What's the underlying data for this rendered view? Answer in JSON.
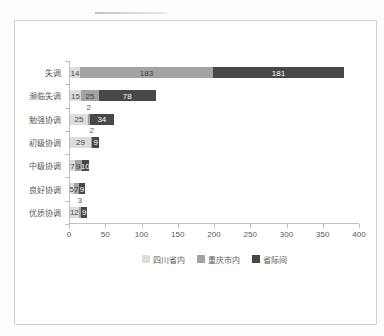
{
  "chart_data": {
    "type": "bar",
    "orientation": "horizontal",
    "stacked": true,
    "title": "",
    "categories": [
      "失调",
      "濒临失调",
      "勉强协调",
      "初级协调",
      "中级协调",
      "良好协调",
      "优质协调"
    ],
    "series": [
      {
        "name": "四川省内",
        "color": "#dcdcdc",
        "label_color": "#4a4a4a",
        "values": [
          14,
          15,
          25,
          29,
          7,
          5,
          12
        ]
      },
      {
        "name": "重庆市内",
        "color": "#a3a3a3",
        "label_color": "#3d3d3d",
        "values": [
          183,
          25,
          2,
          2,
          9,
          7,
          3
        ]
      },
      {
        "name": "省际间",
        "color": "#484848",
        "label_color": "#ffffff",
        "values": [
          181,
          78,
          34,
          9,
          10,
          9,
          9
        ]
      }
    ],
    "x_ticks": [
      "0",
      "50",
      "100",
      "150",
      "200",
      "250",
      "300",
      "350",
      "400"
    ],
    "xlim": [
      0,
      400
    ],
    "grid": false,
    "legend_position": "bottom",
    "small_label_threshold": 3,
    "axis_text_color": "#595959"
  }
}
